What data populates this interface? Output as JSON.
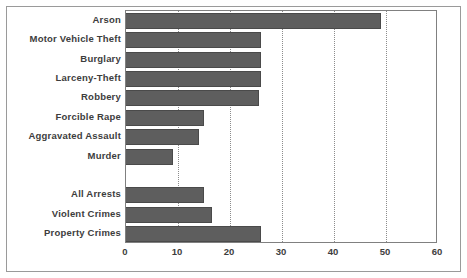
{
  "chart_data": {
    "type": "bar",
    "orientation": "horizontal",
    "title": "",
    "subtitle": "",
    "xlabel": "",
    "ylabel": "",
    "xlim": [
      0,
      60
    ],
    "ylim": null,
    "grid": "vertical-dotted",
    "legend": null,
    "xticks": [
      "0",
      "10",
      "20",
      "30",
      "40",
      "50",
      "60"
    ],
    "xtick_values": [
      0,
      10,
      20,
      30,
      40,
      50,
      60
    ],
    "categories": [
      "Arson",
      "Motor Vehicle Theft",
      "Burglary",
      "Larceny-Theft",
      "Robbery",
      "Forcible Rape",
      "Aggravated Assault",
      "Murder",
      "",
      "All Arrests",
      "Violent Crimes",
      "Property Crimes"
    ],
    "values": [
      49,
      26,
      26,
      26,
      25.5,
      15,
      14,
      9,
      null,
      15,
      16.5,
      26
    ],
    "bars": [
      {
        "label": "Arson",
        "value": 49
      },
      {
        "label": "Motor Vehicle Theft",
        "value": 26
      },
      {
        "label": "Burglary",
        "value": 26
      },
      {
        "label": "Larceny-Theft",
        "value": 26
      },
      {
        "label": "Robbery",
        "value": 25.5
      },
      {
        "label": "Forcible Rape",
        "value": 15
      },
      {
        "label": "Aggravated Assault",
        "value": 14
      },
      {
        "label": "Murder",
        "value": 9
      },
      {
        "label": "",
        "value": null
      },
      {
        "label": "All Arrests",
        "value": 15
      },
      {
        "label": "Violent Crimes",
        "value": 16.5
      },
      {
        "label": "Property Crimes",
        "value": 26
      }
    ],
    "colors": {
      "bar_fill": "#5e5e5e",
      "bar_edge": "#4a4a4a",
      "plot_border": "#808080",
      "gridline": "#8c8c8c",
      "text": "#3d3d3d",
      "background": "#ffffff",
      "outer_frame": "#9a9a9a"
    }
  }
}
